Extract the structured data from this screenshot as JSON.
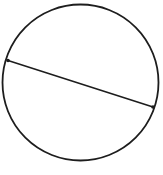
{
  "canvas": {
    "width": 163,
    "height": 175,
    "background_color": "#ffffff",
    "title": "Circle with chord"
  },
  "chart_data": {
    "type": "diagram",
    "diagram_kind": "geometry-circle-with-chord",
    "title": "",
    "xlabel": "",
    "ylabel": "",
    "grid": false,
    "legend": null,
    "annotations": [],
    "shapes": [
      {
        "name": "circle",
        "kind": "circle",
        "center_x": 80.5,
        "center_y": 82.5,
        "radius": 78,
        "stroke_color": "#1d1d1d",
        "stroke_width": 1.8,
        "fill": "none"
      },
      {
        "name": "chord",
        "kind": "line",
        "x1": 8,
        "y1": 60.5,
        "x2": 153,
        "y2": 107,
        "stroke_color": "#1d1d1d",
        "stroke_width": 1.6
      }
    ],
    "points": [
      {
        "name": "chord-endpoint-left",
        "x": 8,
        "y": 60.5,
        "radius": 1.8,
        "color": "#1d1d1d"
      },
      {
        "name": "chord-endpoint-right",
        "x": 153,
        "y": 107,
        "radius": 1.8,
        "color": "#1d1d1d"
      }
    ]
  }
}
